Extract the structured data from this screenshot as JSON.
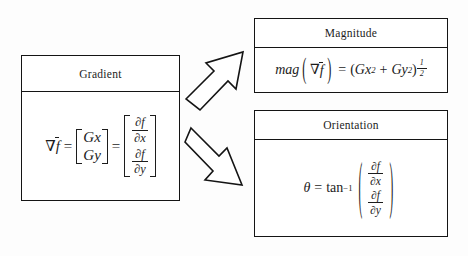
{
  "diagram": {
    "background_color": "#fdfdfd",
    "line_color": "#141414",
    "text_color": "#1c1c1c"
  },
  "gradient_box": {
    "header": "Gradient",
    "formula_plain": "∇f̄ = [Gx; Gy] = [∂f/∂x; ∂f/∂y]",
    "lhs": "∇",
    "lhs_vector": "f",
    "equals": "=",
    "matrix1": {
      "row1": "Gx",
      "row2": "Gy"
    },
    "matrix2": {
      "row1": {
        "numerator": "∂f",
        "denominator": "∂x"
      },
      "row2": {
        "numerator": "∂f",
        "denominator": "∂y"
      }
    }
  },
  "magnitude_box": {
    "header": "Magnitude",
    "formula_plain": "mag(∇f̄) = (Gx² + Gy²)^(1/2)",
    "func_name": "mag",
    "nabla": "∇",
    "arg_vector": "f",
    "equals": "=",
    "open_paren": "(",
    "term1_base": "Gx",
    "term1_exp": "2",
    "plus": "+",
    "term2_base": "Gy",
    "term2_exp": "2",
    "close_paren": ")",
    "exponent": {
      "numerator": "1",
      "denominator": "2"
    }
  },
  "orientation_box": {
    "header": "Orientation",
    "formula_plain": "θ = tan⁻¹( (∂f/∂x) / (∂f/∂y) )",
    "theta": "θ",
    "equals": "=",
    "func_name": "tan",
    "func_exp": "−1",
    "open_paren": "(",
    "close_paren": ")",
    "numerator_frac": {
      "numerator": "∂f",
      "denominator": "∂x"
    },
    "denominator_frac": {
      "numerator": "∂f",
      "denominator": "∂y"
    }
  },
  "arrows": [
    {
      "name": "arrow-to-magnitude",
      "direction": "up-right"
    },
    {
      "name": "arrow-to-orientation",
      "direction": "down-right"
    }
  ]
}
